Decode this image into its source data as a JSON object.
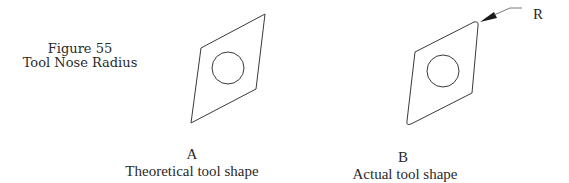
{
  "figure": {
    "number_label": "Figure 55",
    "title": "Tool Nose Radius"
  },
  "shapes": [
    {
      "letter": "A",
      "caption": "Theoretical tool shape",
      "corner_type": "sharp"
    },
    {
      "letter": "B",
      "caption": "Actual tool shape",
      "corner_type": "rounded"
    }
  ],
  "callout": {
    "label": "R"
  },
  "colors": {
    "line": "#3a3a3a",
    "text": "#2a2a2a",
    "background": "#ffffff"
  }
}
